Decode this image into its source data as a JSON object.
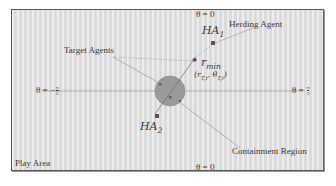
{
  "diagram": {
    "play_area_label": "Play Area",
    "herding_agent_label": "Herding Agent",
    "target_agents_label": "Target Agents",
    "containment_region_label": "Containment Region",
    "r_min_label": "r",
    "r_min_sub": "min",
    "target_coord_label": "(r",
    "target_coord_sub": "T,i",
    "target_coord_mid": ", θ",
    "target_coord_sub2": "T,i",
    "target_coord_end": ")",
    "ha1_label": "HA",
    "ha1_sub": "1",
    "ha2_label": "HA",
    "ha2_sub": "2",
    "theta_top": "θ = 0",
    "theta_bottom": "θ = 0",
    "theta_left_prefix": "θ = −",
    "theta_left_num": "π",
    "theta_left_den": "2",
    "theta_right_prefix": "θ = ",
    "theta_right_num": "π",
    "theta_right_den": "2",
    "colors": {
      "background": "#e2e2e2",
      "border": "#5a5a5a",
      "circle": "#9a9a9a",
      "agent": "#555555",
      "line": "#6a6a6a",
      "text": "#3a3a3a"
    }
  }
}
